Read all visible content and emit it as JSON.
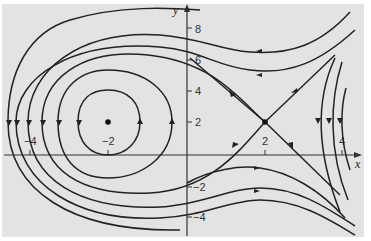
{
  "diagram": {
    "type": "phase_portrait",
    "axes": {
      "x_label": "x",
      "y_label": "y",
      "x_ticks": [
        {
          "value": -4,
          "label": "−4"
        },
        {
          "value": -2,
          "label": "−2"
        },
        {
          "value": 2,
          "label": "2"
        },
        {
          "value": 4,
          "label": "4"
        }
      ],
      "y_ticks": [
        {
          "value": 8,
          "label": "8"
        },
        {
          "value": 6,
          "label": "6"
        },
        {
          "value": 4,
          "label": "4"
        },
        {
          "value": 2,
          "label": "2"
        },
        {
          "value": -2,
          "label": "−2"
        },
        {
          "value": -4,
          "label": "−4"
        }
      ]
    },
    "equilibria": [
      {
        "name": "center",
        "x": -2,
        "y": 2
      },
      {
        "name": "saddle",
        "x": 2,
        "y": 2
      }
    ],
    "colors": {
      "background": "#e3e3e3",
      "curve": "#222222",
      "axis": "#333333"
    }
  }
}
